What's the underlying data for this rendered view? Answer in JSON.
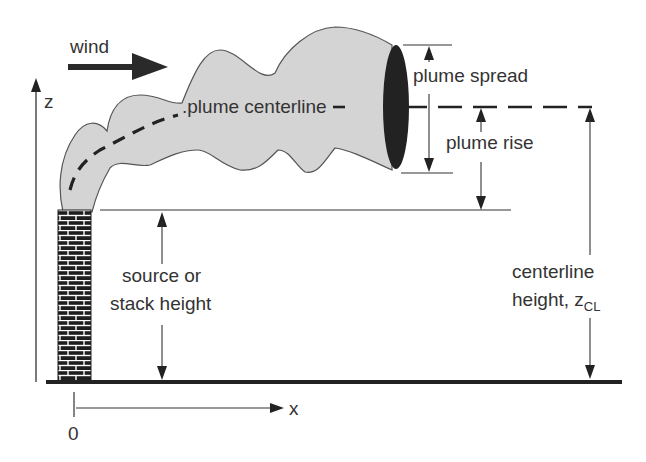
{
  "diagram": {
    "labels": {
      "wind": "wind",
      "z_axis": "z",
      "x_axis": "x",
      "origin": "0",
      "plume_centerline": ".plume centerline",
      "plume_spread": "plume spread",
      "plume_rise": "plume rise",
      "stack_height_line1": "source or",
      "stack_height_line2": "stack height",
      "centerline_height_line1": "centerline",
      "centerline_height_line2": "height, z",
      "centerline_height_subscript": "CL"
    },
    "colors": {
      "plume_fill": "#d4d4d4",
      "plume_outline": "#555555",
      "plume_end": "#222222",
      "brick_dark": "#1e1e1e",
      "ground": "#222222",
      "text": "#333333"
    }
  }
}
